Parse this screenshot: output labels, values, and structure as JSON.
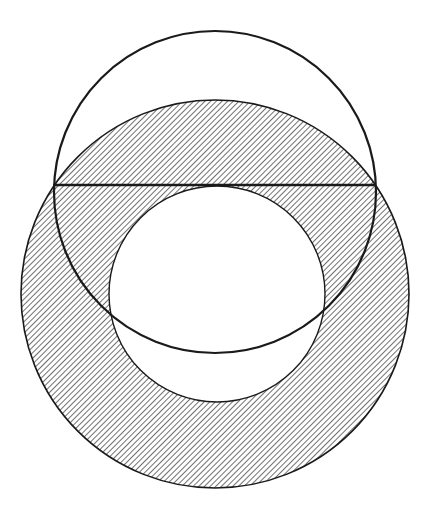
{
  "diagram": {
    "type": "geometry",
    "colors": {
      "background": "#ffffff",
      "stroke": "#1a1a1a",
      "hatch": "#333333"
    },
    "annulus": {
      "outer_circle": {
        "cx": 215,
        "cy": 294,
        "r": 194
      },
      "inner_circle": {
        "cx": 217,
        "cy": 294,
        "r": 108
      },
      "fill": "diagonal-hatch"
    },
    "upper_circle": {
      "cx": 215,
      "cy": 192,
      "r": 161,
      "fill": "none"
    },
    "chord": {
      "x1": 53,
      "y1": 185,
      "x2": 376,
      "y2": 185,
      "tangent_to": "inner_circle"
    },
    "hatch": {
      "angle_deg": 45,
      "spacing_px": 4
    }
  }
}
